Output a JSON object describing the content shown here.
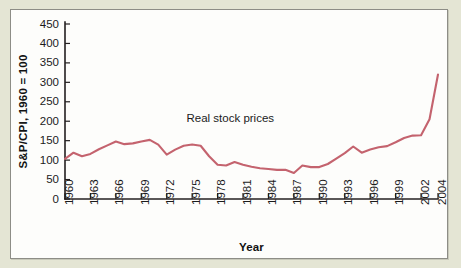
{
  "figure": {
    "panel_background": "#fdfdfb",
    "page_background": "#e4e5d4",
    "border_color": "#8d8d86"
  },
  "chart_data": {
    "type": "line",
    "title": "",
    "subtitle": "",
    "xlabel": "Year",
    "ylabel": "S&P/CPI, 1960 = 100",
    "xlim": [
      1960,
      2004
    ],
    "ylim": [
      0,
      450
    ],
    "grid": false,
    "legend_position": "none",
    "annotations": [
      {
        "text": "Real stock prices",
        "x": 1979.5,
        "y": 197
      }
    ],
    "ytick_labels": [
      "0",
      "50",
      "100",
      "150",
      "200",
      "250",
      "300",
      "350",
      "400",
      "450"
    ],
    "yticks": [
      0,
      50,
      100,
      150,
      200,
      250,
      300,
      350,
      400,
      450
    ],
    "xtick_labels": [
      "1960",
      "1963",
      "1966",
      "1969",
      "1972",
      "1975",
      "1978",
      "1981",
      "1984",
      "1987",
      "1990",
      "1993",
      "1996",
      "1999",
      "2002",
      "2004"
    ],
    "xticks": [
      1960,
      1963,
      1966,
      1969,
      1972,
      1975,
      1978,
      1981,
      1984,
      1987,
      1990,
      1993,
      1996,
      1999,
      2002,
      2004
    ],
    "series": [
      {
        "name": "Real stock prices",
        "color": "#c4636e",
        "x": [
          1960,
          1961,
          1962,
          1963,
          1964,
          1965,
          1966,
          1967,
          1968,
          1969,
          1970,
          1971,
          1972,
          1973,
          1974,
          1975,
          1976,
          1977,
          1978,
          1979,
          1980,
          1981,
          1982,
          1983,
          1984,
          1985,
          1986,
          1987,
          1988,
          1989,
          1990,
          1991,
          1992,
          1993,
          1994,
          1995,
          1996,
          1997,
          1998,
          1999,
          2000,
          2001,
          2002,
          2003,
          2004
        ],
        "values": [
          103,
          119,
          110,
          116,
          128,
          138,
          148,
          141,
          143,
          148,
          152,
          140,
          114,
          127,
          137,
          140,
          137,
          110,
          88,
          86,
          95,
          88,
          83,
          79,
          77,
          75,
          75,
          67,
          86,
          82,
          82,
          90,
          104,
          118,
          135,
          119,
          127,
          133,
          136,
          146,
          157,
          163,
          164,
          205,
          320
        ]
      }
    ]
  },
  "axis": {
    "y_label_text": "S&P/CPI, 1960 = 100",
    "x_label_text": "Year"
  }
}
